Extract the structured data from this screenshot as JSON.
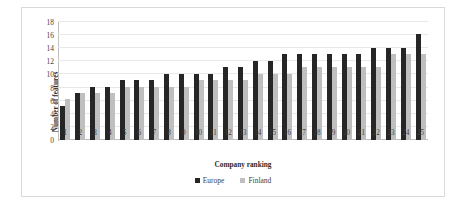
{
  "chart_data": {
    "type": "bar",
    "title": "",
    "xlabel": "Company ranking",
    "ylabel": "Number of features",
    "categories": [
      "1",
      "2",
      "3",
      "4",
      "5",
      "6",
      "7",
      "8",
      "9",
      "10",
      "11",
      "12",
      "13",
      "14",
      "15",
      "16",
      "17",
      "18",
      "19",
      "20",
      "21",
      "22",
      "23",
      "24",
      "25"
    ],
    "series": [
      {
        "name": "Europe",
        "color": "#262626",
        "values": [
          5.2,
          7.1,
          8.1,
          8.1,
          9.1,
          9.1,
          9.1,
          10.1,
          10.1,
          10.1,
          10.1,
          11.1,
          11.1,
          12.1,
          12.1,
          13.1,
          13.1,
          13.1,
          13.1,
          13.1,
          13.1,
          14.1,
          14.1,
          14.1,
          16.2
        ]
      },
      {
        "name": "Finland",
        "color": "#bfbfbf",
        "values": [
          6.2,
          7.1,
          7.1,
          7.1,
          8.1,
          8.1,
          8.1,
          8.1,
          8.1,
          9.1,
          9.1,
          9.1,
          9.1,
          10.1,
          10.1,
          10.1,
          11.1,
          11.1,
          11.1,
          11.1,
          11.1,
          11.1,
          13.1,
          13.1,
          13.1
        ]
      }
    ],
    "ylim": [
      0,
      18
    ],
    "yticks": [
      0,
      2,
      4,
      6,
      8,
      10,
      12,
      14,
      16,
      18
    ],
    "grid": true,
    "legend_position": "bottom-center"
  },
  "legend": {
    "items": [
      {
        "label": "Europe"
      },
      {
        "label": "Finland"
      }
    ]
  }
}
